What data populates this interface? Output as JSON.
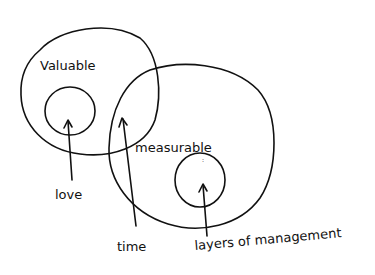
{
  "diagram": {
    "type": "venn",
    "background": "#ffffff",
    "ink_color": "#111111",
    "sets": [
      {
        "id": "valuable",
        "label": "Valuable"
      },
      {
        "id": "measurable",
        "label": "measurable"
      }
    ],
    "inner_items": [
      {
        "id": "love",
        "label": "love",
        "location": "inside Valuable only"
      },
      {
        "id": "layers",
        "label": "layers of management",
        "location": "inside measurable only"
      }
    ],
    "pointer_labels": [
      {
        "id": "love",
        "label": "love",
        "points_to": "small circle inside Valuable"
      },
      {
        "id": "time",
        "label": "time",
        "points_to": "intersection of Valuable and measurable"
      },
      {
        "id": "layers",
        "label": "layers of management",
        "points_to": "small circle inside measurable"
      }
    ]
  }
}
